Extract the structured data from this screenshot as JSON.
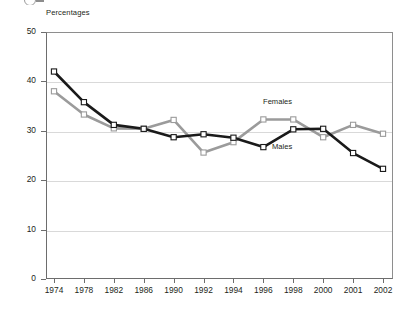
{
  "axis_title": "Percentages",
  "series_labels": {
    "females": "Females",
    "males": "Males"
  },
  "colors": {
    "males": "#1a1a1a",
    "females": "#9b9b9b",
    "marker_fill": "#ffffff",
    "grid": "#d9d9d9",
    "frame": "#6d6d6d"
  },
  "chart_data": {
    "type": "line",
    "title": "",
    "subtitle": "",
    "xlabel": "",
    "ylabel": "Percentages",
    "categories": [
      "1974",
      "1978",
      "1982",
      "1986",
      "1990",
      "1992",
      "1994",
      "1996",
      "1998",
      "2000",
      "2001",
      "2002"
    ],
    "ylim": [
      0,
      50
    ],
    "yticks": [
      0,
      10,
      20,
      30,
      40,
      50
    ],
    "grid": true,
    "legend": "inline-annotation",
    "series": [
      {
        "name": "Males",
        "color": "#1a1a1a",
        "values": [
          42.0,
          35.8,
          31.2,
          30.4,
          28.7,
          29.3,
          28.6,
          26.7,
          30.3,
          30.4,
          25.5,
          22.3
        ]
      },
      {
        "name": "Females",
        "color": "#9b9b9b",
        "values": [
          38.0,
          33.3,
          30.5,
          30.4,
          32.2,
          25.6,
          27.7,
          32.3,
          32.3,
          28.7,
          31.2,
          29.4
        ]
      }
    ]
  }
}
